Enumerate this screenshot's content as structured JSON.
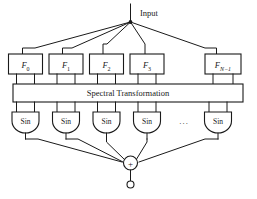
{
  "figure": {
    "background_color": "#ffffff",
    "line_color": "#1a1a1a"
  },
  "input": {
    "label": "Input",
    "node_name": "input-fanout-node"
  },
  "filters": [
    {
      "id": "f0",
      "base": "F",
      "sub": "0",
      "sub_italic": false
    },
    {
      "id": "f1",
      "base": "F",
      "sub": "1",
      "sub_italic": false
    },
    {
      "id": "f2",
      "base": "F",
      "sub": "2",
      "sub_italic": false
    },
    {
      "id": "f3",
      "base": "F",
      "sub": "3",
      "sub_italic": false
    },
    {
      "id": "fn-1",
      "base": "F",
      "sub": "N−1",
      "sub_italic": true
    }
  ],
  "transform": {
    "label": "Spectral Transformation"
  },
  "activations": [
    {
      "id": "sin0",
      "label": "Sin"
    },
    {
      "id": "sin1",
      "label": "Sin"
    },
    {
      "id": "sin2",
      "label": "Sin"
    },
    {
      "id": "sin3",
      "label": "Sin"
    },
    {
      "id": "sinN",
      "label": "Sin"
    }
  ],
  "ellipsis": {
    "label": "···"
  },
  "summation": {
    "label": "+",
    "node_name": "summation-node"
  },
  "output": {
    "terminal_name": "output-terminal"
  }
}
